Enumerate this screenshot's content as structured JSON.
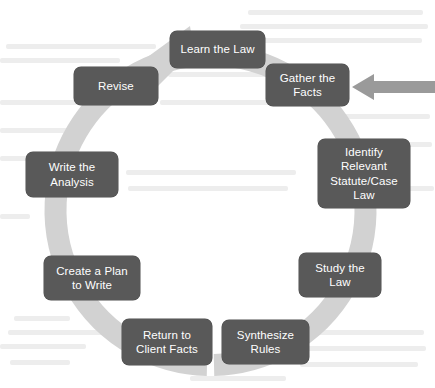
{
  "diagram": {
    "type": "cycle",
    "direction": "clockwise",
    "colors": {
      "node_fill": "#595959",
      "node_text": "#ffffff",
      "ring": "#d2d2d2",
      "entry_arrow": "#9a9a9a",
      "background": "#ffffff"
    },
    "entry_arrow": {
      "name": "entry-arrow",
      "points_to": "Gather the Facts",
      "direction": "left"
    },
    "ring": {
      "name": "cycle-ring",
      "has_arrowhead": true,
      "arrowhead_position": "top-left",
      "gap_position": "bottom"
    },
    "steps": [
      {
        "id": "learn-the-law",
        "label": "Learn the Law",
        "order": 1
      },
      {
        "id": "gather-the-facts",
        "label": "Gather the\nFacts",
        "order": 2
      },
      {
        "id": "identify-statute",
        "label": "Identify\nRelevant\nStatute/Case\nLaw",
        "order": 3
      },
      {
        "id": "study-the-law",
        "label": "Study the\nLaw",
        "order": 4
      },
      {
        "id": "synthesize-rules",
        "label": "Synthesize\nRules",
        "order": 5
      },
      {
        "id": "return-to-client-facts",
        "label": "Return to\nClient Facts",
        "order": 6
      },
      {
        "id": "create-a-plan",
        "label": "Create a Plan\nto Write",
        "order": 7
      },
      {
        "id": "write-the-analysis",
        "label": "Write the\nAnalysis",
        "order": 8
      },
      {
        "id": "revise",
        "label": "Revise",
        "order": 9
      }
    ]
  }
}
